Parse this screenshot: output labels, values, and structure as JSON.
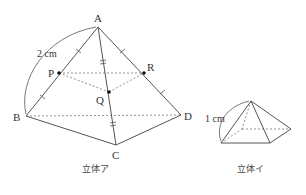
{
  "solid_a": {
    "caption": "立体ア",
    "vertices": {
      "A": "A",
      "B": "B",
      "C": "C",
      "D": "D"
    },
    "points": {
      "P": "P",
      "Q": "Q",
      "R": "R"
    },
    "edge_length_label": "2 cm"
  },
  "solid_b": {
    "caption": "立体イ",
    "edge_length_label": "1 cm"
  },
  "colors": {
    "line": "#555555",
    "text": "#333333",
    "background": "#ffffff"
  }
}
